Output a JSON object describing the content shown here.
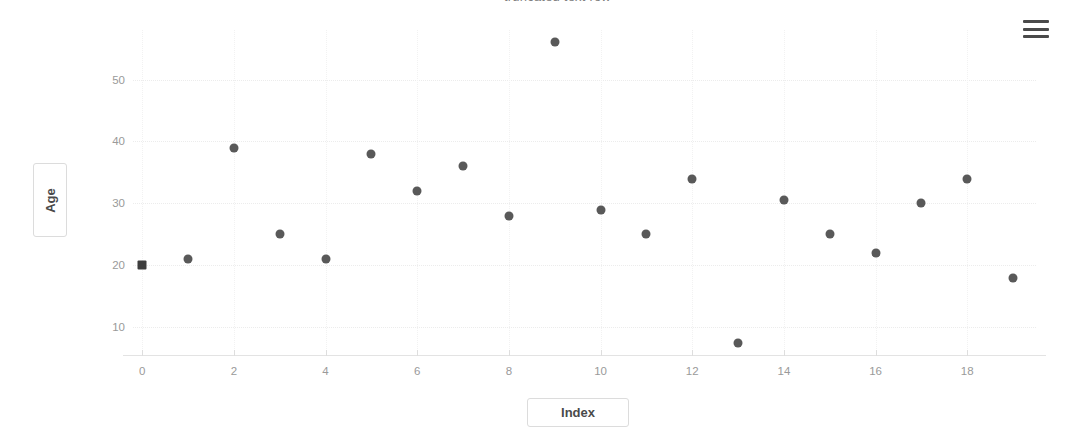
{
  "header": {
    "clipped_text": "— truncated text row —"
  },
  "toolbar": {
    "menu_icon": "hamburger-menu-icon"
  },
  "chart_data": {
    "type": "scatter",
    "title": "",
    "xlabel": "Index",
    "ylabel": "Age",
    "x": [
      0,
      1,
      2,
      3,
      4,
      5,
      6,
      7,
      8,
      9,
      10,
      11,
      12,
      13,
      14,
      15,
      16,
      17,
      18,
      19
    ],
    "values": [
      20,
      21,
      39,
      25,
      21,
      38,
      32,
      36,
      28,
      56,
      29,
      25,
      34,
      7.5,
      30.5,
      25,
      22,
      30,
      34,
      18
    ],
    "xlim": [
      -0.2,
      19.5
    ],
    "ylim": [
      5.5,
      58
    ],
    "xticks": [
      0,
      2,
      4,
      6,
      8,
      10,
      12,
      14,
      16,
      18
    ],
    "yticks": [
      10,
      20,
      30,
      40,
      50
    ],
    "xtick_labels": [
      "0",
      "2",
      "4",
      "6",
      "8",
      "10",
      "12",
      "14",
      "16",
      "18"
    ],
    "ytick_labels": [
      "10",
      "20",
      "30",
      "40",
      "50"
    ],
    "grid": true,
    "legend": false,
    "marker_color": "#595959",
    "selected_index": 0,
    "selected_marker": "square"
  }
}
